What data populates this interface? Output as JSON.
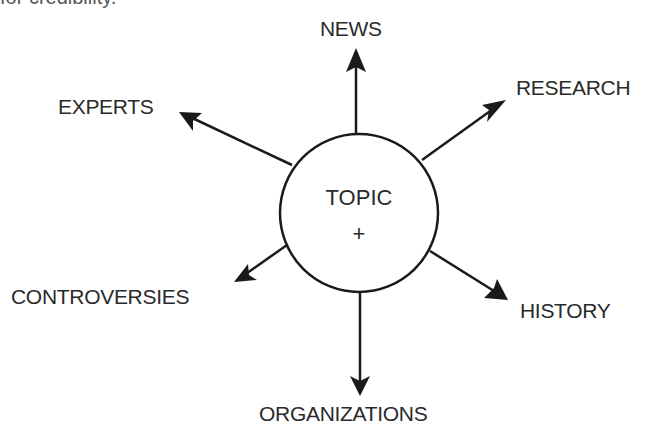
{
  "header_fragment": "for credibility.",
  "center": {
    "title": "TOPIC",
    "symbol": "+"
  },
  "branches": [
    {
      "id": "news",
      "label": "NEWS"
    },
    {
      "id": "research",
      "label": "RESEARCH"
    },
    {
      "id": "history",
      "label": "HISTORY"
    },
    {
      "id": "organizations",
      "label": "ORGANIZATIONS"
    },
    {
      "id": "controversies",
      "label": "CONTROVERSIES"
    },
    {
      "id": "experts",
      "label": "EXPERTS"
    }
  ],
  "colors": {
    "stroke": "#1a1a1a",
    "text": "#2a2a2a",
    "background": "#ffffff"
  }
}
